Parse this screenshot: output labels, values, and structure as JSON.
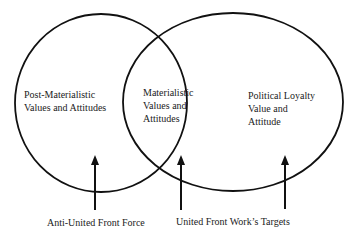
{
  "diagram": {
    "type": "venn",
    "sets": [
      {
        "id": "left",
        "lines": [
          "Post-Materialistic",
          "Values and Attitudes"
        ]
      },
      {
        "id": "overlap",
        "lines": [
          "Materialistic",
          "Values and",
          "Attitudes"
        ]
      },
      {
        "id": "right",
        "lines": [
          "Political Loyalty",
          "Value and",
          "Attitude"
        ]
      }
    ],
    "arrows": [
      {
        "id": "anti-force",
        "label": "Anti-United Front Force"
      },
      {
        "id": "targets",
        "label": "United Front Work’s Targets"
      }
    ],
    "colors": {
      "stroke": "#111111",
      "text": "#222222",
      "background": "#ffffff"
    }
  }
}
